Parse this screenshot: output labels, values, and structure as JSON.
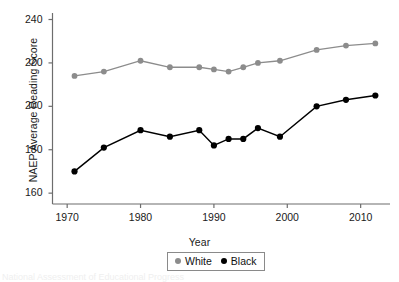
{
  "chart_data": {
    "type": "line",
    "title": "",
    "xlabel": "Year",
    "ylabel": "NAEP Average Reading Score",
    "xlim": [
      1968,
      2014
    ],
    "ylim": [
      155,
      243
    ],
    "xticks": [
      1970,
      1980,
      1990,
      2000,
      2010
    ],
    "yticks": [
      160,
      180,
      200,
      220,
      240
    ],
    "grid": false,
    "legend_position": "bottom-center",
    "series": [
      {
        "name": "White",
        "color": "#8c8c8c",
        "marker": "circle",
        "points": [
          {
            "x": 1971,
            "y": 214
          },
          {
            "x": 1975,
            "y": 216
          },
          {
            "x": 1980,
            "y": 221
          },
          {
            "x": 1984,
            "y": 218
          },
          {
            "x": 1988,
            "y": 218
          },
          {
            "x": 1990,
            "y": 217
          },
          {
            "x": 1992,
            "y": 216
          },
          {
            "x": 1994,
            "y": 218
          },
          {
            "x": 1996,
            "y": 220
          },
          {
            "x": 1999,
            "y": 221
          },
          {
            "x": 2004,
            "y": 226
          },
          {
            "x": 2008,
            "y": 228
          },
          {
            "x": 2012,
            "y": 229
          }
        ]
      },
      {
        "name": "Black",
        "color": "#000000",
        "marker": "circle",
        "points": [
          {
            "x": 1971,
            "y": 170
          },
          {
            "x": 1975,
            "y": 181
          },
          {
            "x": 1980,
            "y": 189
          },
          {
            "x": 1984,
            "y": 186
          },
          {
            "x": 1988,
            "y": 189
          },
          {
            "x": 1990,
            "y": 182
          },
          {
            "x": 1992,
            "y": 185
          },
          {
            "x": 1994,
            "y": 185
          },
          {
            "x": 1996,
            "y": 190
          },
          {
            "x": 1999,
            "y": 186
          },
          {
            "x": 2004,
            "y": 200
          },
          {
            "x": 2008,
            "y": 203
          },
          {
            "x": 2012,
            "y": 205
          }
        ]
      }
    ]
  },
  "legend": {
    "entries": [
      {
        "label": "White",
        "color": "#8c8c8c"
      },
      {
        "label": "Black",
        "color": "#000000"
      }
    ]
  },
  "footnote": {
    "text": "National Assessment of Educational Progress"
  }
}
